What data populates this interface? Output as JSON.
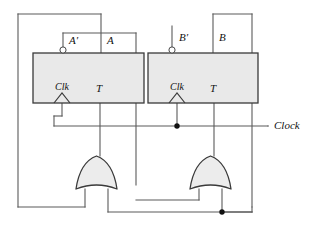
{
  "figure": {
    "background_color": "#ffffff",
    "wire_color": "#5a5a5a",
    "block_fill": "#e9e9e9",
    "block_stroke": "#3a3a3a",
    "gate_fill": "#ececec",
    "junction_color": "#111111"
  },
  "flipflops": [
    {
      "id": "ff-a",
      "output_label": "A",
      "complement_output_label": "A′",
      "clock_label": "Clk",
      "input_label": "T",
      "has_inverting_bubble": true
    },
    {
      "id": "ff-b",
      "output_label": "B",
      "complement_output_label": "B′",
      "clock_label": "Clk",
      "input_label": "T",
      "has_inverting_bubble": true
    }
  ],
  "gates": [
    {
      "id": "or-gate-left",
      "type": "or",
      "inputs": 2,
      "orientation": "up"
    },
    {
      "id": "or-gate-right",
      "type": "or",
      "inputs": 2,
      "orientation": "up"
    }
  ],
  "signals": {
    "clock_label": "Clock"
  },
  "junction_count": 2
}
